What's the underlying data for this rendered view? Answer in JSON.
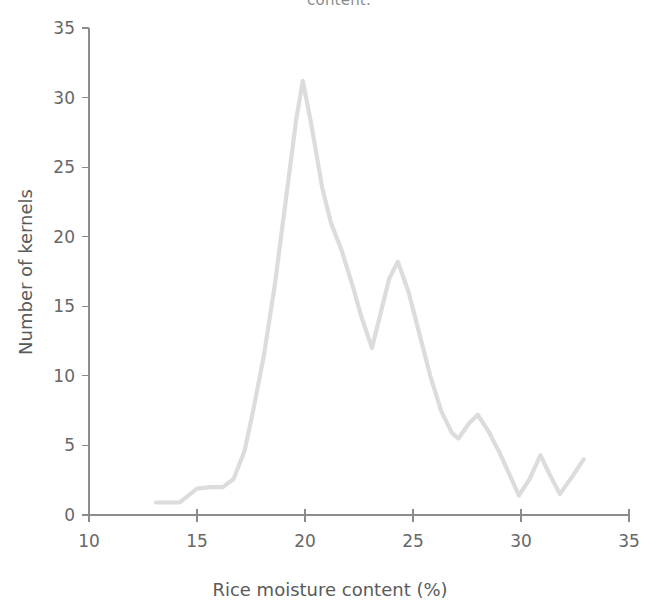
{
  "caption_fragment": "content.",
  "chart_data": {
    "type": "line",
    "title": "",
    "subtitle": "",
    "xlabel": "Rice moisture content (%)",
    "ylabel": "Number of kernels",
    "xlim": [
      10,
      35
    ],
    "ylim": [
      0,
      35
    ],
    "xticks": [
      10,
      15,
      20,
      25,
      30,
      35
    ],
    "yticks": [
      0,
      5,
      10,
      15,
      20,
      25,
      30,
      35
    ],
    "xtick_labels": [
      "10",
      "15",
      "20",
      "25",
      "30",
      "35"
    ],
    "ytick_labels": [
      "0",
      "5",
      "10",
      "15",
      "20",
      "25",
      "30",
      "35"
    ],
    "grid": false,
    "legend": false,
    "legend_position": "none",
    "line_color": "#dcdcdc",
    "line_width": 4.2,
    "series": [
      {
        "name": "Kernel moisture distribution",
        "x": [
          13.1,
          14.2,
          15.0,
          15.6,
          16.2,
          16.7,
          17.2,
          17.6,
          18.1,
          18.6,
          19.1,
          19.6,
          19.9,
          20.3,
          20.8,
          21.2,
          21.7,
          22.2,
          22.6,
          23.1,
          23.5,
          23.9,
          24.3,
          24.8,
          25.3,
          25.8,
          26.3,
          26.8,
          27.1,
          27.6,
          28.0,
          28.5,
          29.0,
          29.5,
          29.9,
          30.4,
          30.9,
          31.3,
          31.8,
          32.3,
          32.9
        ],
        "y": [
          0.9,
          0.9,
          1.9,
          2.0,
          2.0,
          2.6,
          4.6,
          7.5,
          11.5,
          16.5,
          22.5,
          28.5,
          31.2,
          28.0,
          23.5,
          21.0,
          19.0,
          16.5,
          14.3,
          12.0,
          14.5,
          17.0,
          18.2,
          16.0,
          13.0,
          10.0,
          7.5,
          5.9,
          5.5,
          6.6,
          7.2,
          6.0,
          4.5,
          2.8,
          1.4,
          2.6,
          4.3,
          3.0,
          1.5,
          2.6,
          4.0
        ]
      }
    ]
  }
}
